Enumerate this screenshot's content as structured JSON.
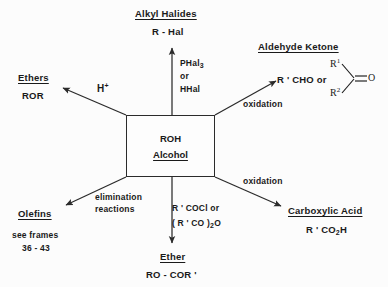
{
  "diagram": {
    "center": {
      "formula": "ROH",
      "name": "Alcohol"
    },
    "products": [
      {
        "id": "alkyl-halides",
        "title": "Alkyl  Halides",
        "formula": "R - Hal",
        "reagent_lines": [
          "PHal",
          "or",
          "HHal"
        ],
        "reagent_subscript": "3",
        "direction": "up"
      },
      {
        "id": "ethers",
        "title": "Ethers",
        "formula": "ROR",
        "reagent": "H",
        "reagent_superscript": "+",
        "direction": "up-left"
      },
      {
        "id": "aldehyde-ketone",
        "title": "Aldehyde  Ketone",
        "formula": "R ' CHO  or",
        "reagent": "oxidation",
        "direction": "up-right",
        "structure": {
          "r1": "R",
          "r1_superscript": "1",
          "r2": "R",
          "r2_superscript": "2",
          "oxygen": "O"
        }
      },
      {
        "id": "carboxylic-acid",
        "title": "Carboxylic  Acid",
        "formula": "R ' CO",
        "formula_subscript": "2",
        "formula_tail": "H",
        "reagent": "oxidation",
        "direction": "down-right"
      },
      {
        "id": "ether",
        "title": "Ether",
        "formula": "RO - COR '",
        "reagent_line1": "R ' COCl  or",
        "reagent_line2_a": "( R ' CO )",
        "reagent_line2_sub": "2",
        "reagent_line2_b": "O",
        "direction": "down"
      },
      {
        "id": "olefins",
        "title": "Olefins",
        "note_line1": "see  frames",
        "note_line2": "36 - 43",
        "reagent_line1": "elimination",
        "reagent_line2": "reactions",
        "direction": "down-left"
      }
    ],
    "colors": {
      "line": "#2b2b2b",
      "text": "#1a1a1a",
      "background": "#fcfcfc"
    }
  }
}
